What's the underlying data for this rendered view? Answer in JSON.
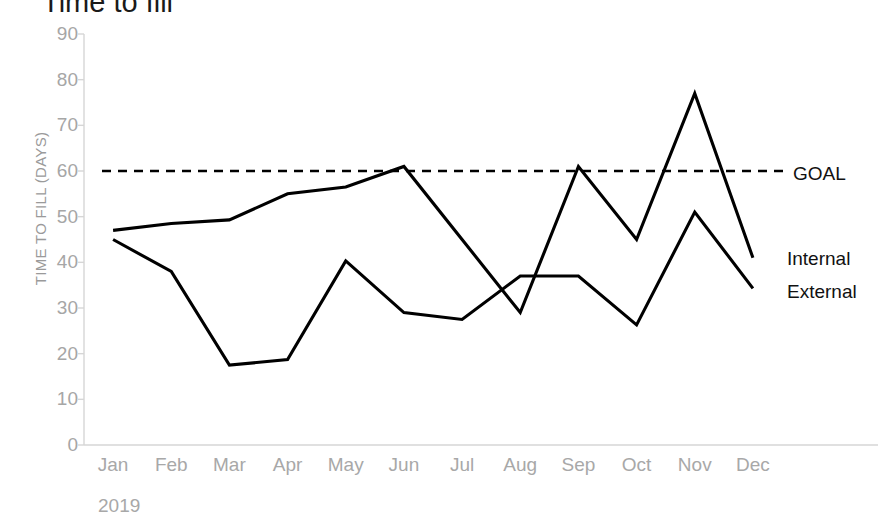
{
  "chart_data": {
    "type": "line",
    "title": "Time to fill",
    "xlabel": "2019",
    "ylabel": "TIME TO FILL (DAYS)",
    "ylim": [
      0,
      90
    ],
    "ytick_step": 10,
    "yticks": [
      90,
      80,
      70,
      60,
      50,
      40,
      30,
      20,
      10,
      0
    ],
    "categories": [
      "Jan",
      "Feb",
      "Mar",
      "Apr",
      "May",
      "Jun",
      "Jul",
      "Aug",
      "Sep",
      "Oct",
      "Nov",
      "Dec"
    ],
    "grid": false,
    "legend_position": "right-inline",
    "series": [
      {
        "name": "Internal",
        "values": [
          47,
          48.5,
          49.3,
          55,
          56.5,
          61,
          45,
          29,
          61,
          45,
          77,
          41
        ],
        "color": "#000000",
        "style": "solid"
      },
      {
        "name": "External",
        "values": [
          45,
          38,
          17.5,
          18.7,
          40.3,
          29,
          27.5,
          37,
          37,
          26.3,
          51,
          34.3
        ],
        "color": "#000000",
        "style": "solid"
      }
    ],
    "reference_lines": [
      {
        "name": "GOAL",
        "value": 60,
        "style": "dashed",
        "color": "#000000"
      }
    ],
    "annotations": {
      "goal_label": "GOAL",
      "internal_label": "Internal",
      "external_label": "External"
    }
  },
  "colors": {
    "axis": "#d6d6d6",
    "tick_text": "#a8a8a8",
    "series": "#000000",
    "title": "#1a1a1a"
  }
}
